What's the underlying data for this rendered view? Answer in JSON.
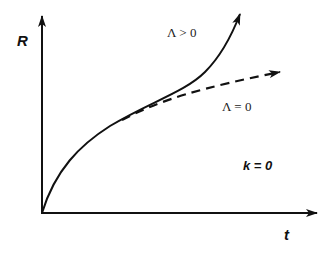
{
  "diagram": {
    "type": "plot-sketch",
    "axes": {
      "y_label": "R",
      "x_label": "t"
    },
    "curves": [
      {
        "id": "lambda-positive",
        "label": "Λ > 0",
        "style": "solid",
        "color": "#111111"
      },
      {
        "id": "lambda-zero",
        "label": "Λ = 0",
        "style": "dashed",
        "color": "#111111"
      }
    ],
    "annotation": "k = 0",
    "background": "#ffffff"
  }
}
